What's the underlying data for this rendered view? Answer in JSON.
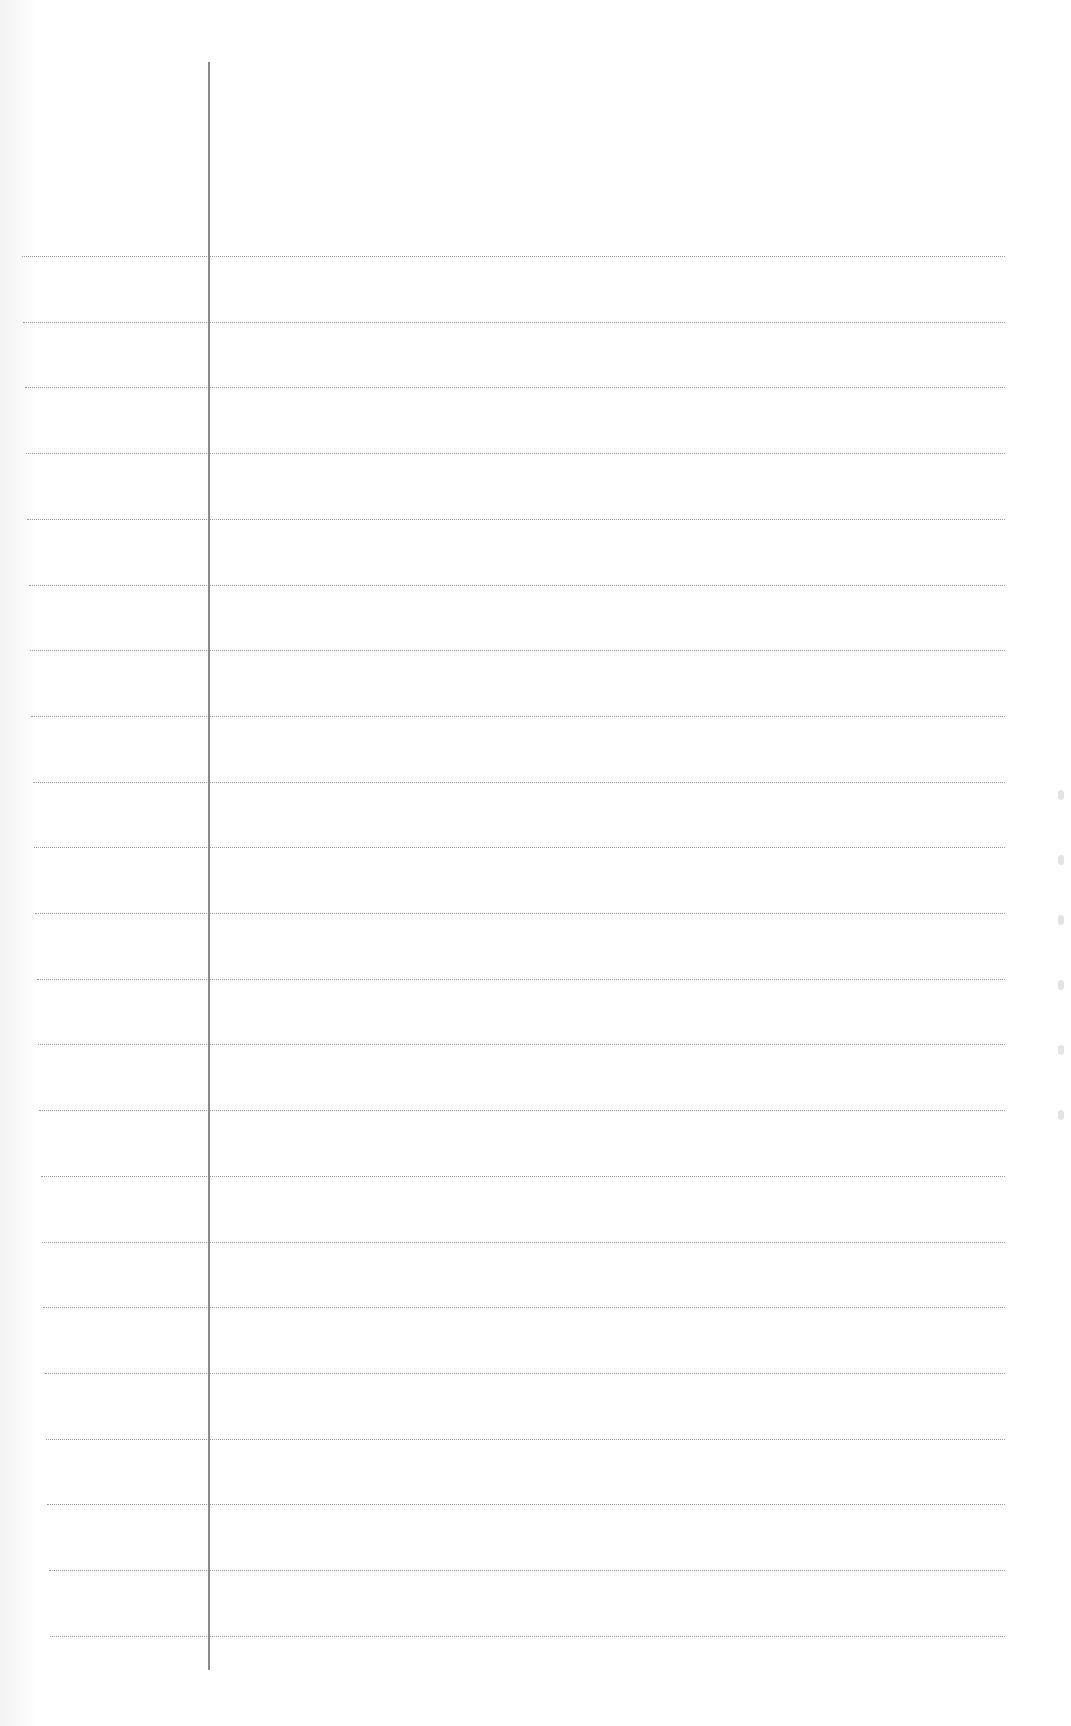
{
  "page": {
    "type": "lined-paper",
    "background": "#ffffff",
    "rule_color": "#9a9a9a",
    "margin_line_color": "#8a8a8a",
    "margin_line": {
      "x": 208,
      "top": 62,
      "bottom": 1670
    },
    "rules": {
      "count": 22,
      "first_y": 256,
      "spacing": 65.7,
      "right_x": 1005,
      "left_x_start": 22,
      "left_x_end": 50
    },
    "text": ""
  }
}
